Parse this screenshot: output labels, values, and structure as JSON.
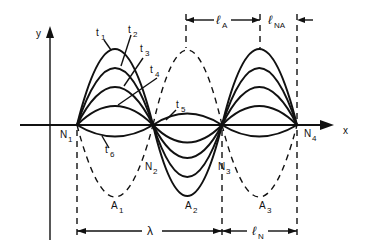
{
  "diagram": {
    "axes": {
      "y_label": "y",
      "x_label": "x"
    },
    "nodes": [
      {
        "label": "N",
        "sub": "1"
      },
      {
        "label": "N",
        "sub": "2"
      },
      {
        "label": "N",
        "sub": "3"
      },
      {
        "label": "N",
        "sub": "4"
      }
    ],
    "antinodes": [
      {
        "label": "A",
        "sub": "1"
      },
      {
        "label": "A",
        "sub": "2"
      },
      {
        "label": "A",
        "sub": "3"
      }
    ],
    "time_labels": [
      {
        "label": "t",
        "sub": "1"
      },
      {
        "label": "t",
        "sub": "2"
      },
      {
        "label": "t",
        "sub": "3"
      },
      {
        "label": "t",
        "sub": "4"
      },
      {
        "label": "t",
        "sub": "5"
      },
      {
        "label": "t",
        "sub": "6"
      }
    ],
    "dimensions": {
      "top": [
        {
          "label": "ℓ",
          "sub": "A"
        },
        {
          "label": "ℓ",
          "sub": "NA"
        }
      ],
      "bottom": [
        {
          "label": "λ",
          "sub": ""
        },
        {
          "label": "ℓ",
          "sub": "N"
        }
      ]
    }
  }
}
